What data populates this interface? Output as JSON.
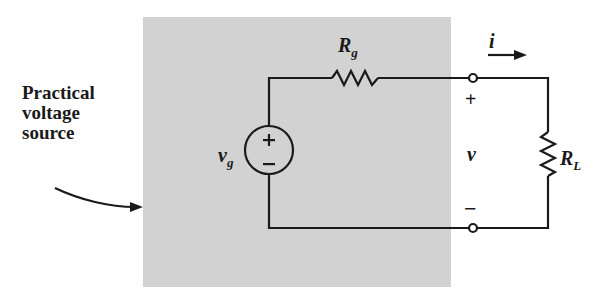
{
  "diagram": {
    "caption": {
      "lines": [
        "Practical",
        "voltage",
        "source"
      ]
    },
    "labels": {
      "source_resistor": {
        "main": "R",
        "sub": "g"
      },
      "source_voltage": {
        "main": "v",
        "sub": "g"
      },
      "load_resistor": {
        "main": "R",
        "sub": "L"
      },
      "current": "i",
      "terminal_voltage": "v",
      "plus_terminal": "+",
      "minus_terminal": "−",
      "source_plus": "+",
      "source_minus": "−"
    },
    "components": [
      {
        "type": "voltage-source",
        "name": "vg"
      },
      {
        "type": "resistor",
        "name": "Rg",
        "position": "series, top"
      },
      {
        "type": "terminal",
        "name": "positive terminal"
      },
      {
        "type": "terminal",
        "name": "negative terminal"
      },
      {
        "type": "resistor",
        "name": "RL",
        "position": "load, right"
      }
    ],
    "colors": {
      "shaded_region": "#d2d2d2",
      "wire": "#1a1a1a",
      "background": "#ffffff"
    }
  }
}
